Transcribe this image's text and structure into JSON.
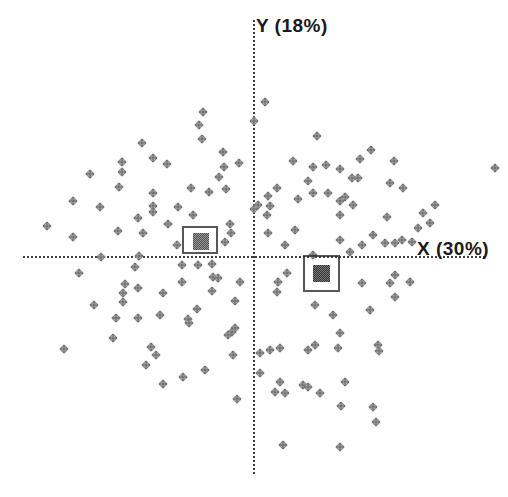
{
  "chart_data": {
    "type": "scatter",
    "title": "",
    "xlabel": "X (30%)",
    "ylabel": "Y (18%)",
    "legend": "none",
    "grid": false,
    "tick_labels": "none",
    "axis_color": "#2e2e2e",
    "point_color": "#7e7e7e",
    "point_shape": "dithered-diamond",
    "point_size_px": 7,
    "axes": {
      "origin_px": [
        254,
        257
      ],
      "y_axis": {
        "x": 254,
        "y1": 20,
        "y2": 474
      },
      "x_axis": {
        "y": 257,
        "x1": 23,
        "x2": 485
      },
      "x_label_pos_px": [
        417,
        238
      ],
      "y_label_pos_px": [
        256,
        15
      ]
    },
    "points_px": [
      [
        142,
        143
      ],
      [
        153,
        158
      ],
      [
        167,
        164
      ],
      [
        122,
        162
      ],
      [
        122,
        172
      ],
      [
        90,
        174
      ],
      [
        119,
        187
      ],
      [
        153,
        193
      ],
      [
        73,
        201
      ],
      [
        100,
        207
      ],
      [
        153,
        206
      ],
      [
        153,
        212
      ],
      [
        138,
        218
      ],
      [
        47,
        226
      ],
      [
        168,
        224
      ],
      [
        118,
        231
      ],
      [
        265,
        102
      ],
      [
        254,
        121
      ],
      [
        203,
        112
      ],
      [
        199,
        125
      ],
      [
        202,
        139
      ],
      [
        223,
        152
      ],
      [
        317,
        136
      ],
      [
        224,
        167
      ],
      [
        239,
        163
      ],
      [
        219,
        177
      ],
      [
        293,
        161
      ],
      [
        313,
        167
      ],
      [
        326,
        165
      ],
      [
        340,
        169
      ],
      [
        308,
        181
      ],
      [
        191,
        188
      ],
      [
        209,
        192
      ],
      [
        226,
        189
      ],
      [
        277,
        188
      ],
      [
        268,
        196
      ],
      [
        313,
        193
      ],
      [
        328,
        193
      ],
      [
        298,
        199
      ],
      [
        340,
        201
      ],
      [
        178,
        207
      ],
      [
        193,
        215
      ],
      [
        270,
        206
      ],
      [
        258,
        205
      ],
      [
        254,
        209
      ],
      [
        267,
        215
      ],
      [
        295,
        230
      ],
      [
        230,
        224
      ],
      [
        231,
        233
      ],
      [
        371,
        150
      ],
      [
        360,
        159
      ],
      [
        394,
        161
      ],
      [
        352,
        178
      ],
      [
        358,
        178
      ],
      [
        390,
        183
      ],
      [
        403,
        188
      ],
      [
        345,
        197
      ],
      [
        353,
        205
      ],
      [
        435,
        205
      ],
      [
        387,
        217
      ],
      [
        423,
        213
      ],
      [
        430,
        223
      ],
      [
        418,
        228
      ],
      [
        495,
        168
      ],
      [
        340,
        215
      ],
      [
        73,
        237
      ],
      [
        143,
        233
      ],
      [
        101,
        257
      ],
      [
        139,
        256
      ],
      [
        135,
        267
      ],
      [
        79,
        273
      ],
      [
        125,
        284
      ],
      [
        138,
        288
      ],
      [
        123,
        293
      ],
      [
        163,
        293
      ],
      [
        94,
        305
      ],
      [
        123,
        302
      ],
      [
        116,
        318
      ],
      [
        138,
        318
      ],
      [
        160,
        315
      ],
      [
        113,
        338
      ],
      [
        64,
        349
      ],
      [
        151,
        347
      ],
      [
        156,
        355
      ],
      [
        146,
        365
      ],
      [
        163,
        384
      ],
      [
        177,
        245
      ],
      [
        225,
        242
      ],
      [
        268,
        233
      ],
      [
        285,
        245
      ],
      [
        313,
        255
      ],
      [
        182,
        265
      ],
      [
        198,
        265
      ],
      [
        212,
        264
      ],
      [
        213,
        277
      ],
      [
        218,
        278
      ],
      [
        182,
        282
      ],
      [
        212,
        291
      ],
      [
        240,
        282
      ],
      [
        287,
        273
      ],
      [
        278,
        282
      ],
      [
        277,
        292
      ],
      [
        235,
        301
      ],
      [
        197,
        309
      ],
      [
        188,
        319
      ],
      [
        189,
        323
      ],
      [
        315,
        305
      ],
      [
        333,
        315
      ],
      [
        235,
        328
      ],
      [
        232,
        332
      ],
      [
        228,
        335
      ],
      [
        233,
        355
      ],
      [
        260,
        353
      ],
      [
        270,
        350
      ],
      [
        280,
        348
      ],
      [
        308,
        350
      ],
      [
        315,
        345
      ],
      [
        338,
        348
      ],
      [
        260,
        373
      ],
      [
        205,
        370
      ],
      [
        183,
        377
      ],
      [
        280,
        382
      ],
      [
        303,
        385
      ],
      [
        308,
        387
      ],
      [
        275,
        392
      ],
      [
        285,
        393
      ],
      [
        320,
        393
      ],
      [
        237,
        399
      ],
      [
        340,
        240
      ],
      [
        350,
        252
      ],
      [
        362,
        245
      ],
      [
        373,
        235
      ],
      [
        385,
        243
      ],
      [
        395,
        243
      ],
      [
        402,
        240
      ],
      [
        412,
        242
      ],
      [
        395,
        275
      ],
      [
        390,
        283
      ],
      [
        362,
        283
      ],
      [
        410,
        282
      ],
      [
        395,
        297
      ],
      [
        370,
        310
      ],
      [
        340,
        333
      ],
      [
        378,
        345
      ],
      [
        379,
        351
      ],
      [
        345,
        382
      ],
      [
        283,
        445
      ],
      [
        341,
        406
      ],
      [
        340,
        447
      ],
      [
        373,
        407
      ],
      [
        376,
        422
      ]
    ],
    "highlight_markers": [
      {
        "name": "left-square-marker",
        "box_px": [
          182,
          226,
          36,
          28
        ],
        "fill_px": [
          193,
          233,
          16,
          17
        ],
        "fill_dark": "#565656",
        "fill_light": "#939393"
      },
      {
        "name": "right-square-marker",
        "box_px": [
          303,
          255,
          37,
          37
        ],
        "fill_px": [
          313,
          265,
          17,
          17
        ],
        "fill_dark": "#383838",
        "fill_light": "#757575"
      }
    ]
  }
}
